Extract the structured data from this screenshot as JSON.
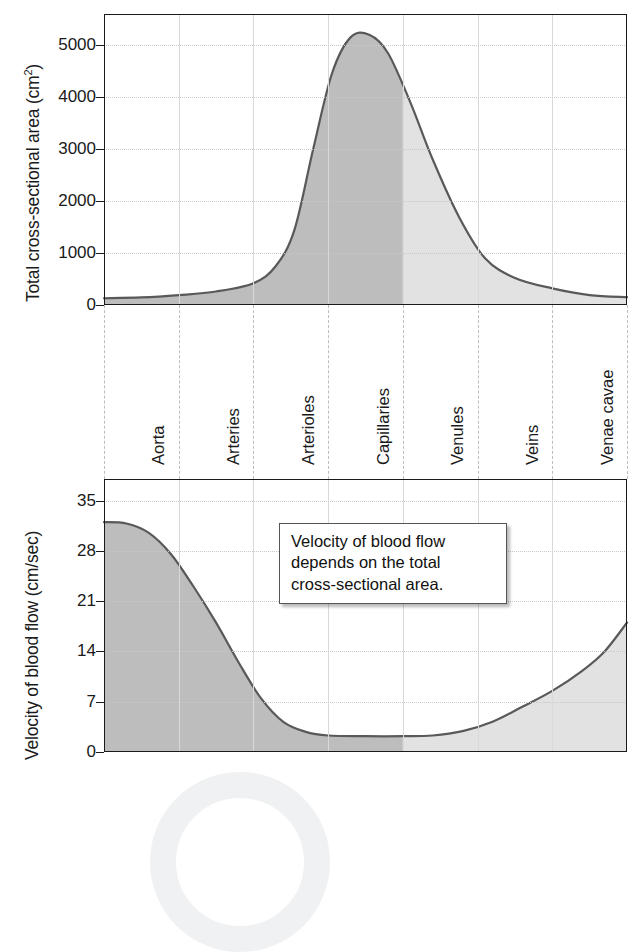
{
  "figure": {
    "watermark": "circular-watermark"
  },
  "categories": [
    "Aorta",
    "Arteries",
    "Arterioles",
    "Capillaries",
    "Venules",
    "Veins",
    "Venae cavae"
  ],
  "callout": {
    "lines": [
      "Velocity of blood flow",
      "depends on the total",
      "cross-sectional area."
    ]
  },
  "colors": {
    "curve_line": "#595959",
    "fill_arterial": "#bdbdbd",
    "fill_venous": "#e2e2e2",
    "axis": "#1a1a1a",
    "gridline": "#d9d9d9",
    "category_dash": "#bdbdbd",
    "watermark": "#f0f1f2"
  },
  "chart_data": [
    {
      "type": "area",
      "id": "total-cross-sectional-area",
      "title": "",
      "xlabel": "",
      "ylabel": "Total cross-sectional area (cm²)",
      "ylabel_main": "Total cross-sectional area (cm",
      "ylabel_sup": "2",
      "ylabel_tail": ")",
      "yticks": [
        0,
        1000,
        2000,
        3000,
        4000,
        5000
      ],
      "ytick_labels": [
        "0",
        "1000",
        "2000",
        "3000",
        "4000",
        "5000"
      ],
      "ylim": [
        0,
        5600
      ],
      "categories": [
        "Aorta",
        "Arteries",
        "Arterioles",
        "Capillaries",
        "Venules",
        "Veins",
        "Venae cavae"
      ],
      "values": [
        130,
        200,
        400,
        5200,
        4000,
        600,
        140
      ],
      "points": [
        {
          "x": 0.0,
          "y": 130
        },
        {
          "x": 0.5,
          "y": 145
        },
        {
          "x": 1.0,
          "y": 190
        },
        {
          "x": 1.5,
          "y": 260
        },
        {
          "x": 2.0,
          "y": 420
        },
        {
          "x": 2.3,
          "y": 750
        },
        {
          "x": 2.55,
          "y": 1450
        },
        {
          "x": 2.8,
          "y": 3000
        },
        {
          "x": 3.05,
          "y": 4450
        },
        {
          "x": 3.3,
          "y": 5150
        },
        {
          "x": 3.55,
          "y": 5200
        },
        {
          "x": 3.8,
          "y": 4850
        },
        {
          "x": 4.1,
          "y": 3900
        },
        {
          "x": 4.4,
          "y": 2800
        },
        {
          "x": 4.75,
          "y": 1700
        },
        {
          "x": 5.1,
          "y": 900
        },
        {
          "x": 5.5,
          "y": 520
        },
        {
          "x": 6.0,
          "y": 320
        },
        {
          "x": 6.5,
          "y": 190
        },
        {
          "x": 7.0,
          "y": 150
        }
      ],
      "peak_value": 5200,
      "peak_category": "Capillaries",
      "grid": true,
      "legend": "none"
    },
    {
      "type": "area",
      "id": "velocity-of-blood-flow",
      "title": "",
      "xlabel": "",
      "ylabel": "Velocity of blood flow (cm/sec)",
      "yticks": [
        0,
        7,
        14,
        21,
        28,
        35
      ],
      "ytick_labels": [
        "0",
        "7",
        "14",
        "21",
        "28",
        "35"
      ],
      "ylim": [
        0,
        38
      ],
      "categories": [
        "Aorta",
        "Arteries",
        "Arterioles",
        "Capillaries",
        "Venules",
        "Veins",
        "Venae cavae"
      ],
      "values": [
        32,
        20,
        3,
        2,
        2,
        5,
        18
      ],
      "points": [
        {
          "x": 0.0,
          "y": 32
        },
        {
          "x": 0.3,
          "y": 31.8
        },
        {
          "x": 0.6,
          "y": 30.5
        },
        {
          "x": 0.9,
          "y": 27.5
        },
        {
          "x": 1.2,
          "y": 23.0
        },
        {
          "x": 1.5,
          "y": 18.0
        },
        {
          "x": 1.8,
          "y": 12.5
        },
        {
          "x": 2.1,
          "y": 7.5
        },
        {
          "x": 2.4,
          "y": 4.2
        },
        {
          "x": 2.7,
          "y": 2.8
        },
        {
          "x": 3.0,
          "y": 2.3
        },
        {
          "x": 3.5,
          "y": 2.2
        },
        {
          "x": 4.0,
          "y": 2.2
        },
        {
          "x": 4.4,
          "y": 2.3
        },
        {
          "x": 4.8,
          "y": 2.9
        },
        {
          "x": 5.2,
          "y": 4.2
        },
        {
          "x": 5.6,
          "y": 6.3
        },
        {
          "x": 6.0,
          "y": 8.5
        },
        {
          "x": 6.4,
          "y": 11.3
        },
        {
          "x": 6.7,
          "y": 14.0
        },
        {
          "x": 7.0,
          "y": 18.0
        }
      ],
      "minimum_value": 2.2,
      "minimum_category": "Capillaries",
      "grid": true,
      "legend": "none"
    }
  ]
}
